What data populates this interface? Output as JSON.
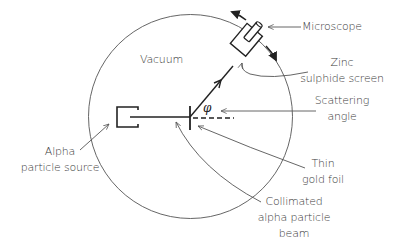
{
  "diagram": {
    "labels": {
      "vacuum": "Vacuum",
      "microscope": "Microscope",
      "zinc_screen_line1": "Zinc",
      "zinc_screen_line2": "sulphide screen",
      "scattering_line1": "Scattering",
      "scattering_line2": "angle",
      "foil_line1": "Thin",
      "foil_line2": "gold foil",
      "beam_line1": "Collimated",
      "beam_line2": "alpha particle",
      "beam_line3": "beam",
      "source_line1": "Alpha",
      "source_line2": "particle source",
      "angle_symbol": "φ"
    },
    "colors": {
      "stroke": "#222222",
      "leader": "#555555",
      "text": "#3a3a3a",
      "background": "#ffffff"
    }
  }
}
